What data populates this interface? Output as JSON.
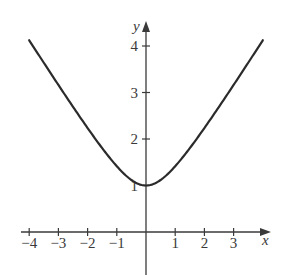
{
  "chart_data": {
    "type": "line",
    "title": "",
    "function": "y = sqrt(1 + x^2)",
    "xlabel": "x",
    "ylabel": "y",
    "xlim": [
      -4,
      4
    ],
    "ylim": [
      0,
      4.2
    ],
    "grid": false,
    "legend": null,
    "x_ticks": [
      -4,
      -3,
      -2,
      -1,
      1,
      2,
      3
    ],
    "x_tick_labels": [
      "−4",
      "−3",
      "−2",
      "−1",
      "1",
      "2",
      "3"
    ],
    "y_ticks": [
      1,
      2,
      3,
      4
    ],
    "y_tick_labels": [
      "1",
      "2",
      "3",
      "4"
    ],
    "series": [
      {
        "name": "curve",
        "color": "#2b2b2b",
        "x": [
          -4,
          -3,
          -2,
          -1,
          0,
          1,
          2,
          3,
          4
        ],
        "y": [
          4.12,
          3.16,
          2.24,
          1.41,
          1.0,
          1.41,
          2.24,
          3.16,
          4.12
        ]
      }
    ]
  },
  "colors": {
    "axis": "#3a3a3a",
    "curve": "#2b2b2b",
    "background": "#ffffff"
  }
}
